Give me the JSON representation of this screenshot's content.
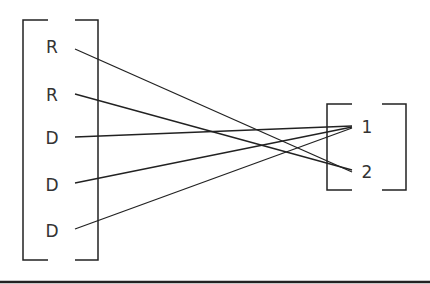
{
  "diagram": {
    "type": "mapping",
    "domain_set": {
      "label": "left-set",
      "elements": [
        "R",
        "R",
        "D",
        "D",
        "D"
      ]
    },
    "codomain_set": {
      "label": "right-set",
      "elements": [
        "1",
        "2"
      ]
    },
    "mappings": [
      {
        "from": 0,
        "from_label": "R",
        "to": 1,
        "to_label": "2"
      },
      {
        "from": 1,
        "from_label": "R",
        "to": 1,
        "to_label": "2"
      },
      {
        "from": 2,
        "from_label": "D",
        "to": 0,
        "to_label": "1"
      },
      {
        "from": 3,
        "from_label": "D",
        "to": 0,
        "to_label": "1"
      },
      {
        "from": 4,
        "from_label": "D",
        "to": 0,
        "to_label": "1"
      }
    ],
    "colors": {
      "stroke": "#222222",
      "text": "#333333",
      "background": "#ffffff"
    }
  }
}
